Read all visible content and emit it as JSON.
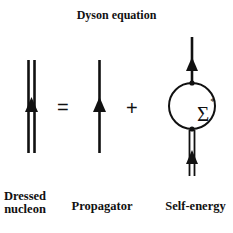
{
  "title": "Dyson equation",
  "operators": {
    "equals": "=",
    "plus": "+"
  },
  "self_energy_symbol": {
    "base": "Σ",
    "superscript": "*"
  },
  "labels": {
    "dressed_line1": "Dressed",
    "dressed_line2": "nucleon",
    "propagator": "Propagator",
    "self_energy": "Self-energy"
  },
  "colors": {
    "line": "#111111",
    "background": "#ffffff"
  }
}
